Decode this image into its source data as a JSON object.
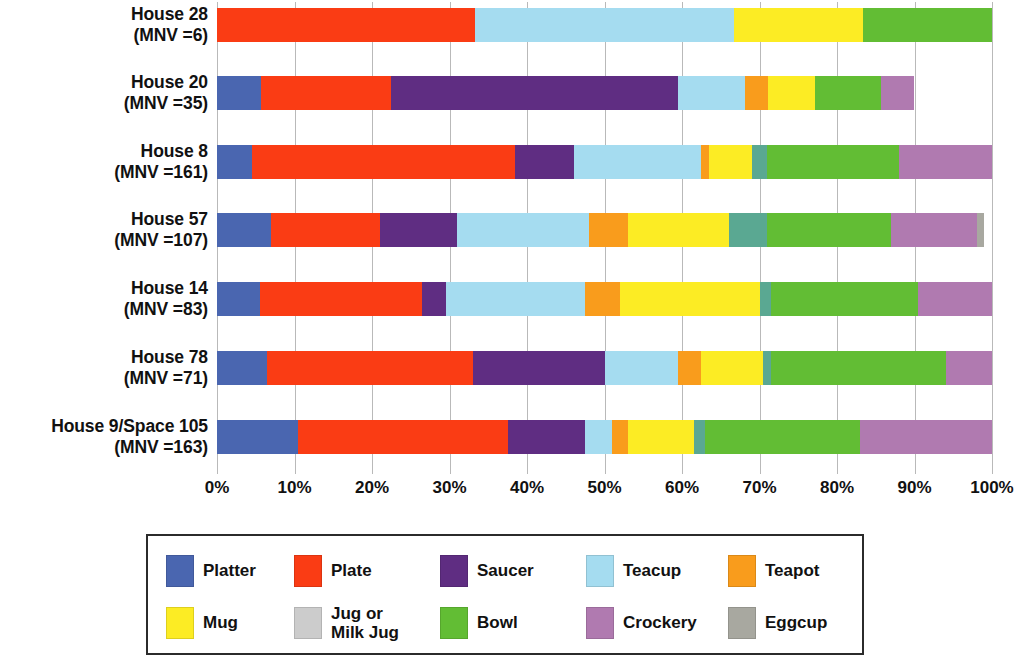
{
  "chart_data": {
    "type": "bar",
    "title": "",
    "subtitle": "",
    "orientation": "horizontal",
    "stacked": true,
    "normalized": true,
    "xlabel": "",
    "ylabel": "",
    "xlim": [
      0,
      100
    ],
    "xtick_labels": [
      "0%",
      "10%",
      "20%",
      "30%",
      "40%",
      "50%",
      "60%",
      "70%",
      "80%",
      "90%",
      "100%"
    ],
    "xtick_values": [
      0,
      10,
      20,
      30,
      40,
      50,
      60,
      70,
      80,
      90,
      100
    ],
    "grid": true,
    "grid_axis": "x",
    "legend_position": "bottom",
    "categories": [
      "House 28 (MNV =6)",
      "House 20 (MNV =35)",
      "House 8 (MNV =161)",
      "House 57 (MNV =107)",
      "House 14 (MNV =83)",
      "House 78 (MNV =71)",
      "House 9/Space 105 (MNV =163)"
    ],
    "category_labels": [
      {
        "line1": "House 28",
        "line2": "(MNV =6)",
        "mnv": 6
      },
      {
        "line1": "House 20",
        "line2": "(MNV =35)",
        "mnv": 35
      },
      {
        "line1": "House 8",
        "line2": "(MNV =161)",
        "mnv": 161
      },
      {
        "line1": "House 57",
        "line2": "(MNV =107)",
        "mnv": 107
      },
      {
        "line1": "House 14",
        "line2": "(MNV =83)",
        "mnv": 83
      },
      {
        "line1": "House 78",
        "line2": "(MNV =71)",
        "mnv": 71
      },
      {
        "line1": "House 9/Space 105",
        "line2": "(MNV =163)",
        "mnv": 163
      }
    ],
    "series": [
      {
        "name": "Platter",
        "color": "#4a66b0",
        "values": [
          0.0,
          5.7,
          4.5,
          7.0,
          5.5,
          6.5,
          10.5
        ]
      },
      {
        "name": "Plate",
        "color": "#fa3c14",
        "values": [
          33.3,
          16.8,
          34.0,
          14.0,
          21.0,
          26.5,
          27.0
        ]
      },
      {
        "name": "Saucer",
        "color": "#5f2d82",
        "values": [
          0.0,
          37.0,
          7.5,
          10.0,
          3.0,
          17.0,
          10.0
        ]
      },
      {
        "name": "Teacup",
        "color": "#a5dcf0",
        "values": [
          33.4,
          8.6,
          16.5,
          17.0,
          18.0,
          9.5,
          3.5
        ]
      },
      {
        "name": "Teapot",
        "color": "#f99c1c",
        "values": [
          0.0,
          3.0,
          1.0,
          5.0,
          4.5,
          3.0,
          2.0
        ]
      },
      {
        "name": "Mug",
        "color": "#fcec24",
        "values": [
          16.6,
          6.0,
          5.5,
          13.0,
          18.0,
          8.0,
          8.5
        ]
      },
      {
        "name": "Jug or Milk Jug",
        "color": "#5aa892",
        "values": [
          0.0,
          0.0,
          2.0,
          5.0,
          1.5,
          1.0,
          1.5
        ]
      },
      {
        "name": "Bowl",
        "color": "#62bd34",
        "values": [
          16.7,
          8.6,
          17.0,
          16.0,
          19.0,
          22.5,
          20.0
        ]
      },
      {
        "name": "Crockery",
        "color": "#b07ab0",
        "values": [
          0.0,
          4.3,
          12.0,
          11.0,
          9.5,
          6.0,
          17.0
        ]
      },
      {
        "name": "Eggcup",
        "color": "#a8a8a0",
        "values": [
          0.0,
          0.0,
          0.0,
          1.0,
          0.0,
          0.0,
          0.0
        ]
      }
    ]
  },
  "legend": {
    "row1": [
      "Platter",
      "Plate",
      "Saucer",
      "Teacup",
      "Teapot"
    ],
    "row2": [
      "Mug",
      "Jug or\nMilk Jug",
      "Bowl",
      "Crockery",
      "Eggcup"
    ]
  }
}
